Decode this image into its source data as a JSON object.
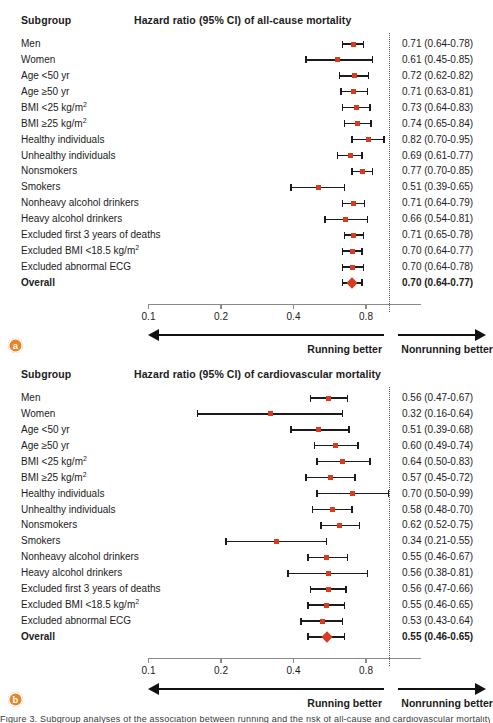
{
  "figure": {
    "subgroup_header": "Subgroup",
    "axis": {
      "scale": "log2",
      "ticks": [
        0.1,
        0.2,
        0.4,
        0.8
      ],
      "tick_labels": [
        "0.1",
        "0.2",
        "0.4",
        "0.8"
      ],
      "reference_line": 1.0,
      "left_arrow_label": "Running better",
      "right_arrow_label": "Nonrunning better"
    },
    "marker_color": "#d93a20",
    "badge_color": "#e8852a",
    "bottom_caption": "Figure 3. Subgroup analyses of the association between running and the risk of all-cause and cardiovascular mortality"
  },
  "chart_data": [
    {
      "type": "forest",
      "panel": "a",
      "panel_label": "a",
      "title": "Hazard ratio (95% CI) of all-cause mortality",
      "xlabel": "",
      "ylabel": "Subgroup",
      "xscale": "log",
      "xlim": [
        0.09,
        1.18
      ],
      "xticks": [
        0.1,
        0.2,
        0.4,
        0.8
      ],
      "reference_line": 1.0,
      "rows": [
        {
          "label": "Men",
          "hr": 0.71,
          "lo": 0.64,
          "hi": 0.78,
          "value": "0.71 (0.64-0.78)",
          "overall": false
        },
        {
          "label": "Women",
          "hr": 0.61,
          "lo": 0.45,
          "hi": 0.85,
          "value": "0.61 (0.45-0.85)",
          "overall": false
        },
        {
          "label": "Age <50 yr",
          "hr": 0.72,
          "lo": 0.62,
          "hi": 0.82,
          "value": "0.72 (0.62-0.82)",
          "overall": false
        },
        {
          "label": "Age ≥50 yr",
          "hr": 0.71,
          "lo": 0.63,
          "hi": 0.81,
          "value": "0.71 (0.63-0.81)",
          "overall": false
        },
        {
          "label": "BMI <25 kg/m",
          "sup": "2",
          "hr": 0.73,
          "lo": 0.64,
          "hi": 0.83,
          "value": "0.73 (0.64-0.83)",
          "overall": false
        },
        {
          "label": "BMI ≥25 kg/m",
          "sup": "2",
          "hr": 0.74,
          "lo": 0.65,
          "hi": 0.84,
          "value": "0.74 (0.65-0.84)",
          "overall": false
        },
        {
          "label": "Healthy individuals",
          "hr": 0.82,
          "lo": 0.7,
          "hi": 0.95,
          "value": "0.82 (0.70-0.95)",
          "overall": false
        },
        {
          "label": "Unhealthy individuals",
          "hr": 0.69,
          "lo": 0.61,
          "hi": 0.77,
          "value": "0.69 (0.61-0.77)",
          "overall": false
        },
        {
          "label": "Nonsmokers",
          "hr": 0.77,
          "lo": 0.7,
          "hi": 0.85,
          "value": "0.77 (0.70-0.85)",
          "overall": false
        },
        {
          "label": "Smokers",
          "hr": 0.51,
          "lo": 0.39,
          "hi": 0.65,
          "value": "0.51 (0.39-0.65)",
          "overall": false
        },
        {
          "label": "Nonheavy alcohol drinkers",
          "hr": 0.71,
          "lo": 0.64,
          "hi": 0.79,
          "value": "0.71 (0.64-0.79)",
          "overall": false
        },
        {
          "label": "Heavy alcohol drinkers",
          "hr": 0.66,
          "lo": 0.54,
          "hi": 0.81,
          "value": "0.66 (0.54-0.81)",
          "overall": false
        },
        {
          "label": "Excluded first 3 years of deaths",
          "hr": 0.71,
          "lo": 0.65,
          "hi": 0.78,
          "value": "0.71 (0.65-0.78)",
          "overall": false
        },
        {
          "label": "Excluded BMI <18.5 kg/m",
          "sup": "2",
          "hr": 0.7,
          "lo": 0.64,
          "hi": 0.77,
          "value": "0.70 (0.64-0.77)",
          "overall": false
        },
        {
          "label": "Excluded abnormal ECG",
          "hr": 0.7,
          "lo": 0.64,
          "hi": 0.78,
          "value": "0.70 (0.64-0.78)",
          "overall": false
        },
        {
          "label": "Overall",
          "hr": 0.7,
          "lo": 0.64,
          "hi": 0.77,
          "value": "0.70 (0.64-0.77)",
          "overall": true
        }
      ]
    },
    {
      "type": "forest",
      "panel": "b",
      "panel_label": "b",
      "title": "Hazard ratio (95% CI) of cardiovascular mortality",
      "xlabel": "",
      "ylabel": "Subgroup",
      "xscale": "log",
      "xlim": [
        0.09,
        1.18
      ],
      "xticks": [
        0.1,
        0.2,
        0.4,
        0.8
      ],
      "reference_line": 1.0,
      "rows": [
        {
          "label": "Men",
          "hr": 0.56,
          "lo": 0.47,
          "hi": 0.67,
          "value": "0.56 (0.47-0.67)",
          "overall": false
        },
        {
          "label": "Women",
          "hr": 0.32,
          "lo": 0.16,
          "hi": 0.64,
          "value": "0.32 (0.16-0.64)",
          "overall": false
        },
        {
          "label": "Age <50 yr",
          "hr": 0.51,
          "lo": 0.39,
          "hi": 0.68,
          "value": "0.51 (0.39-0.68)",
          "overall": false
        },
        {
          "label": "Age ≥50 yr",
          "hr": 0.6,
          "lo": 0.49,
          "hi": 0.74,
          "value": "0.60 (0.49-0.74)",
          "overall": false
        },
        {
          "label": "BMI <25 kg/m",
          "sup": "2",
          "hr": 0.64,
          "lo": 0.5,
          "hi": 0.83,
          "value": "0.64 (0.50-0.83)",
          "overall": false
        },
        {
          "label": "BMI ≥25 kg/m",
          "sup": "2",
          "hr": 0.57,
          "lo": 0.45,
          "hi": 0.72,
          "value": "0.57 (0.45-0.72)",
          "overall": false
        },
        {
          "label": "Healthy individuals",
          "hr": 0.7,
          "lo": 0.5,
          "hi": 0.99,
          "value": "0.70 (0.50-0.99)",
          "overall": false
        },
        {
          "label": "Unhealthy individuals",
          "hr": 0.58,
          "lo": 0.48,
          "hi": 0.7,
          "value": "0.58 (0.48-0.70)",
          "overall": false
        },
        {
          "label": "Nonsmokers",
          "hr": 0.62,
          "lo": 0.52,
          "hi": 0.75,
          "value": "0.62 (0.52-0.75)",
          "overall": false
        },
        {
          "label": "Smokers",
          "hr": 0.34,
          "lo": 0.21,
          "hi": 0.55,
          "value": "0.34 (0.21-0.55)",
          "overall": false
        },
        {
          "label": "Nonheavy alcohol drinkers",
          "hr": 0.55,
          "lo": 0.46,
          "hi": 0.67,
          "value": "0.55 (0.46-0.67)",
          "overall": false
        },
        {
          "label": "Heavy alcohol drinkers",
          "hr": 0.56,
          "lo": 0.38,
          "hi": 0.81,
          "value": "0.56 (0.38-0.81)",
          "overall": false
        },
        {
          "label": "Excluded first 3 years of deaths",
          "hr": 0.56,
          "lo": 0.47,
          "hi": 0.66,
          "value": "0.56 (0.47-0.66)",
          "overall": false
        },
        {
          "label": "Excluded BMI <18.5 kg/m",
          "sup": "2",
          "hr": 0.55,
          "lo": 0.46,
          "hi": 0.65,
          "value": "0.55 (0.46-0.65)",
          "overall": false
        },
        {
          "label": "Excluded abnormal ECG",
          "hr": 0.53,
          "lo": 0.43,
          "hi": 0.64,
          "value": "0.53 (0.43-0.64)",
          "overall": false
        },
        {
          "label": "Overall",
          "hr": 0.55,
          "lo": 0.46,
          "hi": 0.65,
          "value": "0.55 (0.46-0.65)",
          "overall": true
        }
      ]
    }
  ]
}
